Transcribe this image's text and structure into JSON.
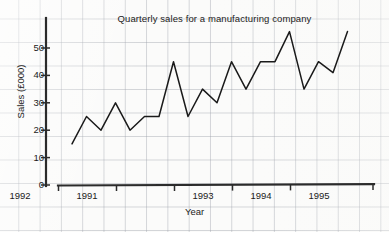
{
  "chart_data": {
    "type": "line",
    "title": "Quarterly sales for a manufacturing company",
    "xlabel": "Year",
    "ylabel": "Sales (£000)",
    "ylim": [
      0,
      58
    ],
    "yticks": [
      0,
      10,
      20,
      30,
      40,
      50
    ],
    "ytick_labels": [
      "0",
      "10",
      "20",
      "30",
      "40",
      "50"
    ],
    "xticks": [
      1991,
      1992,
      1993,
      1994,
      1995
    ],
    "xtick_labels": [
      "1991",
      "1992",
      "1993",
      "1994",
      "1995"
    ],
    "grid": true,
    "grid_style": "graph-paper",
    "legend": null,
    "x": [
      "1991 Q1",
      "1991 Q2",
      "1991 Q3",
      "1991 Q4",
      "1992 Q1",
      "1992 Q2",
      "1992 Q3",
      "1992 Q4",
      "1993 Q1",
      "1993 Q2",
      "1993 Q3",
      "1993 Q4",
      "1994 Q1",
      "1994 Q2",
      "1994 Q3",
      "1994 Q4",
      "1995 Q1",
      "1995 Q2",
      "1995 Q3",
      "1995 Q4"
    ],
    "values": [
      15,
      25,
      20,
      30,
      20,
      25,
      25,
      45,
      25,
      35,
      30,
      45,
      35,
      45,
      45,
      56,
      35,
      45,
      41,
      56
    ],
    "units": "£000",
    "line_color": "#1a1a1a",
    "axis_color": "#2b2b2b",
    "background_color": "#fbfbfa"
  }
}
